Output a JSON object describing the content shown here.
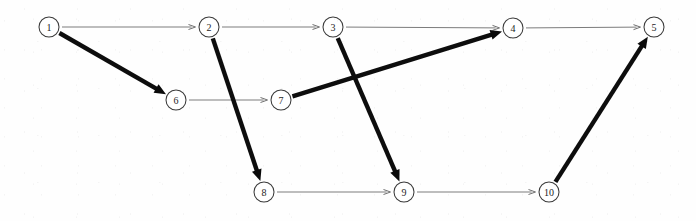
{
  "diagram": {
    "type": "directed-graph",
    "width": 696,
    "height": 221,
    "background_color": "#fefefe",
    "node_radius": 10,
    "style_notes": {
      "thin_edge_color": "#7c7c7c",
      "thick_edge_color": "#0d0d0d",
      "node_stroke_color": "#3a3a3a",
      "node_fill_color": "#ffffff",
      "label_color": "#1e1e1e"
    },
    "nodes": [
      {
        "id": "1",
        "label": "1",
        "x": 49,
        "y": 27,
        "row": "top"
      },
      {
        "id": "2",
        "label": "2",
        "x": 209,
        "y": 27,
        "row": "top"
      },
      {
        "id": "3",
        "label": "3",
        "x": 333,
        "y": 27,
        "row": "top"
      },
      {
        "id": "4",
        "label": "4",
        "x": 513,
        "y": 28,
        "row": "top"
      },
      {
        "id": "5",
        "label": "5",
        "x": 654,
        "y": 27,
        "row": "top"
      },
      {
        "id": "6",
        "label": "6",
        "x": 176,
        "y": 100,
        "row": "middle"
      },
      {
        "id": "7",
        "label": "7",
        "x": 281,
        "y": 100,
        "row": "middle"
      },
      {
        "id": "8",
        "label": "8",
        "x": 264,
        "y": 192,
        "row": "bottom"
      },
      {
        "id": "9",
        "label": "9",
        "x": 404,
        "y": 192,
        "row": "bottom"
      },
      {
        "id": "10",
        "label": "10",
        "x": 549,
        "y": 192,
        "row": "bottom"
      }
    ],
    "edges": [
      {
        "id": "e1",
        "from": "1",
        "to": "2",
        "weight": "thin",
        "label": "1 to 2"
      },
      {
        "id": "e2",
        "from": "2",
        "to": "3",
        "weight": "thin",
        "label": "2 to 3"
      },
      {
        "id": "e3",
        "from": "3",
        "to": "4",
        "weight": "thin",
        "label": "3 to 4"
      },
      {
        "id": "e4",
        "from": "4",
        "to": "5",
        "weight": "thin",
        "label": "4 to 5"
      },
      {
        "id": "e5",
        "from": "6",
        "to": "7",
        "weight": "thin",
        "label": "6 to 7"
      },
      {
        "id": "e6",
        "from": "8",
        "to": "9",
        "weight": "thin",
        "label": "8 to 9"
      },
      {
        "id": "e7",
        "from": "9",
        "to": "10",
        "weight": "thin",
        "label": "9 to 10"
      },
      {
        "id": "e8",
        "from": "1",
        "to": "6",
        "weight": "thick",
        "label": "1 to 6"
      },
      {
        "id": "e9",
        "from": "2",
        "to": "8",
        "weight": "thick",
        "label": "2 to 8"
      },
      {
        "id": "e10",
        "from": "3",
        "to": "9",
        "weight": "thick",
        "label": "3 to 9"
      },
      {
        "id": "e11",
        "from": "7",
        "to": "4",
        "weight": "thick",
        "label": "7 to 4"
      },
      {
        "id": "e12",
        "from": "10",
        "to": "5",
        "weight": "thick",
        "label": "10 to 5"
      }
    ]
  }
}
